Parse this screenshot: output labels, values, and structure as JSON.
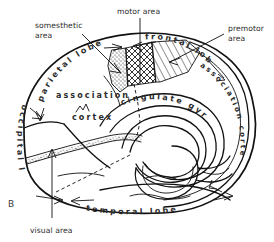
{
  "figure": {
    "panel_label": "B",
    "title_semantic": "medial-surface-of-cerebral-hemisphere",
    "background_color": "#ffffff",
    "line_color": "#111111"
  },
  "callouts": [
    {
      "id": "somesthetic",
      "line1": "somesthetic",
      "line2": "area"
    },
    {
      "id": "motor",
      "line1": "motor area",
      "line2": ""
    },
    {
      "id": "premotor",
      "line1": "premotor",
      "line2": "area"
    },
    {
      "id": "visual",
      "line1": "visual area",
      "line2": ""
    }
  ],
  "region_labels": {
    "parietal_lobe": "parietal lobe",
    "frontal_lobe": "frontal lobe",
    "occipital_lobe": "occipital lobe",
    "temporal_lobe": "temporal lobe",
    "association": "association",
    "cortex": "cortex",
    "cingulate_gyrus": "cingulate gyrus",
    "association_cortex": "association cortex"
  },
  "shading": [
    {
      "id": "somesthetic-area",
      "texture": "stipple",
      "label": "somesthetic area"
    },
    {
      "id": "motor-area",
      "texture": "cross-hatch",
      "label": "motor area"
    },
    {
      "id": "premotor-area",
      "texture": "diagonal-hatch",
      "label": "premotor area"
    },
    {
      "id": "visual-area",
      "texture": "stipple",
      "label": "visual area"
    }
  ]
}
